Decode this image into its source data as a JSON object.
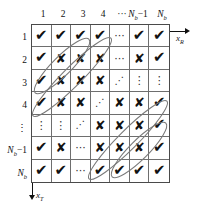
{
  "figure": {
    "axes": {
      "horizontal": {
        "name": "x-R-axis",
        "label": "x",
        "sub": "R",
        "direction": "right"
      },
      "vertical": {
        "name": "x-T-axis",
        "label": "x",
        "sub": "T",
        "direction": "down"
      }
    },
    "column_headers": [
      {
        "text": "1",
        "sub": ""
      },
      {
        "text": "2",
        "sub": ""
      },
      {
        "text": "3",
        "sub": ""
      },
      {
        "text": "4",
        "sub": ""
      },
      {
        "text": "···",
        "sub": ""
      },
      {
        "text": "N",
        "sub": "b",
        "suffix": "−1"
      },
      {
        "text": "N",
        "sub": "b",
        "suffix": ""
      }
    ],
    "row_headers": [
      {
        "text": "1",
        "sub": ""
      },
      {
        "text": "2",
        "sub": ""
      },
      {
        "text": "3",
        "sub": ""
      },
      {
        "text": "4",
        "sub": ""
      },
      {
        "text": "⋮",
        "sub": ""
      },
      {
        "text": "N",
        "sub": "b",
        "suffix": "−1"
      },
      {
        "text": "N",
        "sub": "b",
        "suffix": ""
      }
    ],
    "glyph_legend": {
      "check": "✔",
      "cross": "✘",
      "hdots": "···",
      "vdots": "⋮",
      "ddots": "⋰"
    },
    "colors": {
      "grid_line": "#6e6e6e",
      "grid_border": "#4a4a4a",
      "glyph": "#121212",
      "ellipse": "#7a7a7a",
      "background": "#ffffff"
    },
    "cells": [
      [
        "check",
        "check",
        "check",
        "check",
        "hdots",
        "check",
        "check"
      ],
      [
        "check",
        "cross",
        "cross",
        "cross",
        "hdots",
        "cross",
        "check"
      ],
      [
        "check",
        "cross",
        "cross",
        "cross",
        "ddots",
        "vdots",
        "vdots"
      ],
      [
        "check",
        "cross",
        "cross",
        "ddots",
        "cross",
        "cross",
        "check"
      ],
      [
        "vdots",
        "vdots",
        "ddots",
        "cross",
        "cross",
        "cross",
        "check"
      ],
      [
        "check",
        "cross",
        "hdots",
        "cross",
        "cross",
        "cross",
        "check"
      ],
      [
        "check",
        "check",
        "hdots",
        "check",
        "check",
        "check",
        "check"
      ]
    ],
    "ellipses": [
      {
        "name": "group-ellipse-upper-left-inner",
        "cx": 62,
        "cy": 66,
        "rx": 38,
        "ry": 9.5,
        "rotate": -45
      },
      {
        "name": "group-ellipse-upper-left-outer",
        "cx": 72,
        "cy": 77,
        "rx": 55,
        "ry": 9.5,
        "rotate": -45
      },
      {
        "name": "group-ellipse-lower-right-outer",
        "cx": 128,
        "cy": 140,
        "rx": 55,
        "ry": 9.5,
        "rotate": -45
      },
      {
        "name": "group-ellipse-lower-right-inner",
        "cx": 139,
        "cy": 150,
        "rx": 38,
        "ry": 9.5,
        "rotate": -45
      }
    ]
  }
}
